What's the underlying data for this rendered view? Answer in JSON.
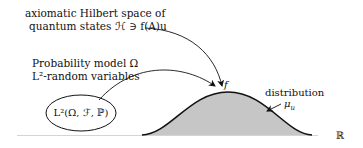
{
  "hilbert_label": {
    "line1": "axiomatic Hilbert space of",
    "line2": "quantum states ℋ ∋ f(A)u"
  },
  "probability_label": {
    "line1": "Probability model Ω",
    "line2": "L²-random variables"
  },
  "ellipse_label": "L²(Ω, ℱ, ℙ)",
  "curve_point_label": "f",
  "distribution_label": "distribution",
  "measure_label": "μ_u",
  "measure_symbol": "μ",
  "measure_subscript": "u",
  "axis_label": "ℝ",
  "colors": {
    "stroke": "#111111",
    "fill": "#c8c8c8",
    "axis": "#d0d0d0"
  }
}
